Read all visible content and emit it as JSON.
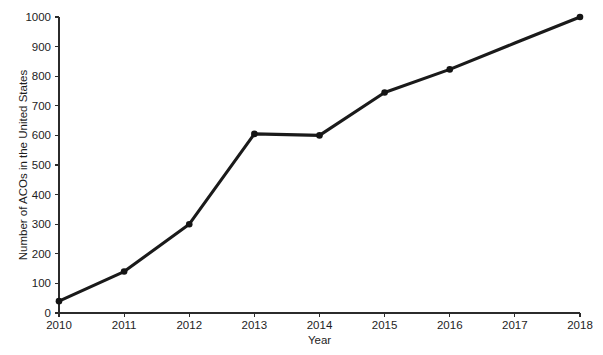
{
  "chart_data": {
    "type": "line",
    "title": "",
    "subtitle": "",
    "xlabel": "Year",
    "ylabel": "Number of ACOs in the United States",
    "x": [
      2010,
      2011,
      2012,
      2013,
      2014,
      2015,
      2016,
      2017,
      2018
    ],
    "xtick_labels": [
      "2010",
      "2011",
      "2012",
      "2013",
      "2014",
      "2015",
      "2016",
      "2017",
      "2018"
    ],
    "ytick_labels": [
      "0",
      "100",
      "200",
      "300",
      "400",
      "500",
      "600",
      "700",
      "800",
      "900",
      "1000"
    ],
    "ytick_values": [
      0,
      100,
      200,
      300,
      400,
      500,
      600,
      700,
      800,
      900,
      1000
    ],
    "xlim": [
      2010,
      2018
    ],
    "ylim": [
      0,
      1000
    ],
    "grid": false,
    "legend": false,
    "legend_position": "none",
    "series": [
      {
        "name": "Number of ACOs in the United States",
        "color": "#1a1a1a",
        "marker": "circle",
        "points": [
          {
            "x": 2010,
            "y": 40,
            "marker": true
          },
          {
            "x": 2011,
            "y": 140,
            "marker": true
          },
          {
            "x": 2012,
            "y": 300,
            "marker": true
          },
          {
            "x": 2013,
            "y": 605,
            "marker": true
          },
          {
            "x": 2014,
            "y": 600,
            "marker": true
          },
          {
            "x": 2015,
            "y": 745,
            "marker": true
          },
          {
            "x": 2016,
            "y": 823,
            "marker": true
          },
          {
            "x": 2017,
            "y": 912,
            "marker": false
          },
          {
            "x": 2018,
            "y": 1000,
            "marker": true
          }
        ],
        "values": [
          40,
          140,
          300,
          605,
          600,
          745,
          823,
          912,
          1000
        ]
      }
    ],
    "annotations": []
  },
  "plot_geometry": {
    "left": 59,
    "right": 580,
    "top": 17,
    "bottom": 313,
    "tick_length": 4,
    "marker_radius": 3.3
  }
}
